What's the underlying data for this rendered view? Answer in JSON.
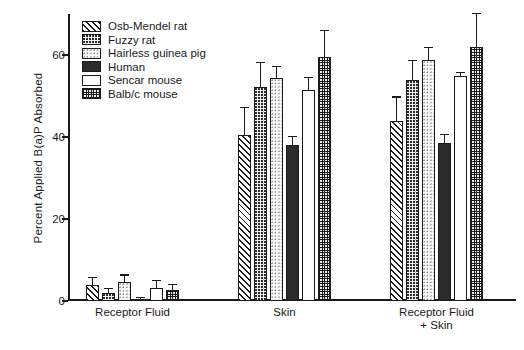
{
  "chart_data": {
    "type": "bar",
    "title": "",
    "xlabel": "",
    "ylabel": "Percent Applied B(a)P Absorbed",
    "ylim": [
      0,
      70
    ],
    "yticks": [
      0,
      20,
      40,
      60
    ],
    "ytick_labels": [
      "0",
      "20",
      "40",
      "60"
    ],
    "grid": false,
    "legend_position": "top-left",
    "categories": [
      "Receptor Fluid",
      "Skin",
      "Receptor Fluid\n+ Skin"
    ],
    "series": [
      {
        "name": "Osb-Mendel rat",
        "pattern": "diagonal-hatch",
        "values": [
          4.0,
          40.5,
          43.8
        ],
        "errors": [
          1.5,
          6.5,
          5.8
        ]
      },
      {
        "name": "Fuzzy rat",
        "pattern": "medium-stipple",
        "values": [
          2.0,
          52.2,
          54.0
        ],
        "errors": [
          1.0,
          5.8,
          4.5
        ]
      },
      {
        "name": "Hairless guinea pig",
        "pattern": "light-stipple",
        "values": [
          4.6,
          54.4,
          58.7
        ],
        "errors": [
          1.6,
          2.6,
          3.0
        ]
      },
      {
        "name": "Human",
        "pattern": "solid-black",
        "values": [
          0.5,
          38.0,
          38.5
        ],
        "errors": [
          0.3,
          2.0,
          2.0
        ]
      },
      {
        "name": "Sencar mouse",
        "pattern": "blank-white",
        "values": [
          3.2,
          51.4,
          54.8
        ],
        "errors": [
          1.6,
          3.0,
          0.8
        ]
      },
      {
        "name": "Balb/c mouse",
        "pattern": "fine-grid",
        "values": [
          2.8,
          59.4,
          62.0
        ],
        "errors": [
          1.0,
          6.4,
          8.0
        ]
      }
    ]
  },
  "colors": {
    "ink": "#1a1a1a",
    "background": "#ffffff",
    "solid_fill": "#2b2b2b"
  }
}
